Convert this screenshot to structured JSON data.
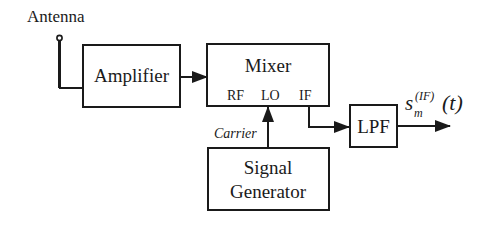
{
  "diagram": {
    "type": "block-diagram",
    "title": "",
    "colors": {
      "stroke": "#1a1a1a",
      "background": "#ffffff"
    },
    "labels": {
      "antenna": "Antenna",
      "amplifier": "Amplifier",
      "mixer": "Mixer",
      "mixer_ports": {
        "rf": "RF",
        "lo": "LO",
        "if": "IF"
      },
      "carrier": "Carrier",
      "signal_generator_line1": "Signal",
      "signal_generator_line2": "Generator",
      "lpf": "LPF",
      "output_s": "s",
      "output_sub": "m",
      "output_sup": "(IF)",
      "output_arg": "(t)"
    },
    "nodes": [
      {
        "id": "antenna",
        "label": "Antenna"
      },
      {
        "id": "amplifier",
        "label": "Amplifier"
      },
      {
        "id": "mixer",
        "label": "Mixer",
        "ports": [
          "RF",
          "LO",
          "IF"
        ]
      },
      {
        "id": "signal_generator",
        "label": "Signal Generator"
      },
      {
        "id": "lpf",
        "label": "LPF"
      },
      {
        "id": "output",
        "label": "s_m^(IF)(t)"
      }
    ],
    "edges": [
      {
        "from": "antenna",
        "to": "amplifier",
        "label": ""
      },
      {
        "from": "amplifier",
        "to": "mixer",
        "label": ""
      },
      {
        "from": "signal_generator",
        "to": "mixer.LO",
        "label": "Carrier"
      },
      {
        "from": "mixer.IF",
        "to": "lpf",
        "label": ""
      },
      {
        "from": "lpf",
        "to": "output",
        "label": "s_m^(IF)(t)"
      }
    ]
  }
}
